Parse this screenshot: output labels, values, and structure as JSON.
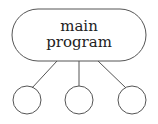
{
  "diagram": {
    "root": {
      "lines": [
        "main",
        "program"
      ]
    },
    "children": [
      {
        "id": "child-1",
        "label": ""
      },
      {
        "id": "child-2",
        "label": ""
      },
      {
        "id": "child-3",
        "label": ""
      }
    ],
    "stroke_color": "#555555"
  }
}
